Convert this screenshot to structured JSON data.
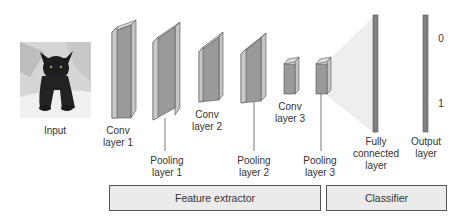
{
  "diagram": {
    "input": {
      "label": "Input",
      "image": "black-cat-photo"
    },
    "layers": [
      {
        "id": "conv1",
        "label": "Conv\nlayer 1"
      },
      {
        "id": "pool1",
        "label": "Pooling\nlayer 1"
      },
      {
        "id": "conv2",
        "label": "Conv\nlayer 2"
      },
      {
        "id": "pool2",
        "label": "Pooling\nlayer 2"
      },
      {
        "id": "conv3",
        "label": "Conv\nlayer 3"
      },
      {
        "id": "pool3",
        "label": "Pooling\nlayer 3"
      },
      {
        "id": "fc",
        "label": "Fully\nconnected\nlayer"
      },
      {
        "id": "output",
        "label": "Output\nlayer"
      }
    ],
    "output_values": [
      "0",
      "1"
    ],
    "sections": [
      {
        "label": "Feature extractor"
      },
      {
        "label": "Classifier"
      }
    ],
    "colors": {
      "layer_front": "#9a9a9a",
      "layer_side": "#c4c4c4",
      "layer_top": "#d8d8d8",
      "fc_bar": "#808080",
      "section_fill": "#ebebeb",
      "fan": "#eeeeee"
    }
  }
}
